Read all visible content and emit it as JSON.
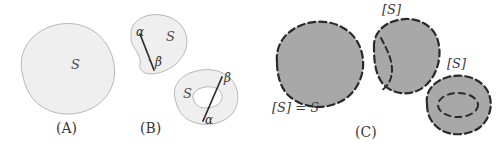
{
  "figure": {
    "background_color": "#ffffff",
    "width": 502,
    "height": 146
  },
  "panels": [
    {
      "id": "A",
      "caption": "(A)",
      "caption_x": 56,
      "caption_y": 122,
      "shapes": [
        {
          "name": "region-s-blob",
          "fill": "#efefef",
          "stroke": "#b0b0b0",
          "stroke_style": "solid",
          "stroke_width": 0.9
        }
      ],
      "labels": [
        {
          "name": "label-s",
          "text": "S",
          "x": 71,
          "y": 66,
          "kind": "italic-S"
        }
      ]
    },
    {
      "id": "B",
      "caption": "(B)",
      "caption_x": 140,
      "caption_y": 122,
      "shapes": [
        {
          "name": "region-s-slit-blob",
          "fill": "#efefef",
          "stroke": "#b0b0b0",
          "stroke_style": "solid",
          "stroke_width": 0.9
        },
        {
          "name": "slit-cut-segment",
          "fill": "none",
          "stroke": "#2d2d2d",
          "stroke_style": "solid",
          "stroke_width": 1.6
        },
        {
          "name": "region-s-hole-blob",
          "fill": "#efefef",
          "stroke": "#b0b0b0",
          "stroke_style": "solid",
          "stroke_width": 0.9
        },
        {
          "name": "inner-hole-outline",
          "fill": "#ffffff",
          "stroke": "#b0b0b0",
          "stroke_style": "solid",
          "stroke_width": 0.9
        },
        {
          "name": "hole-cut-segment",
          "fill": "none",
          "stroke": "#2d2d2d",
          "stroke_style": "solid",
          "stroke_width": 1.6
        }
      ],
      "labels": [
        {
          "name": "label-alpha-upper",
          "text": "α",
          "x": 136,
          "y": 32,
          "kind": "greek"
        },
        {
          "name": "label-beta-upper",
          "text": "β",
          "x": 155,
          "y": 63,
          "kind": "greek"
        },
        {
          "name": "label-s-upper",
          "text": "S",
          "x": 166,
          "y": 38,
          "kind": "italic-S"
        },
        {
          "name": "label-beta-lower",
          "text": "β",
          "x": 224,
          "y": 79,
          "kind": "greek"
        },
        {
          "name": "label-alpha-lower",
          "text": "α",
          "x": 209,
          "y": 118,
          "kind": "greek"
        },
        {
          "name": "label-s-lower",
          "text": "S",
          "x": 183,
          "y": 94,
          "kind": "italic-S"
        }
      ]
    },
    {
      "id": "C",
      "caption": "(C)",
      "caption_x": 355,
      "caption_y": 127,
      "shapes": [
        {
          "name": "closure-big-blob",
          "fill": "#a8a8a8",
          "stroke": "#2a2a2a",
          "stroke_style": "dashed",
          "stroke_width": 2.2
        },
        {
          "name": "closure-slit-blob",
          "fill": "#a8a8a8",
          "stroke": "#2a2a2a",
          "stroke_style": "dashed",
          "stroke_width": 2.2
        },
        {
          "name": "closure-slit-interior-arc",
          "fill": "none",
          "stroke": "#2a2a2a",
          "stroke_style": "dashed",
          "stroke_width": 2.0
        },
        {
          "name": "closure-hole-blob",
          "fill": "#a8a8a8",
          "stroke": "#2a2a2a",
          "stroke_style": "dashed",
          "stroke_width": 2.2
        },
        {
          "name": "closure-hole-interior-ellipse",
          "fill": "none",
          "stroke": "#2a2a2a",
          "stroke_style": "dashed",
          "stroke_width": 2.0
        }
      ],
      "labels": [
        {
          "name": "label-closure-equals-s",
          "text": "[S] = S",
          "x": 272,
          "y": 104,
          "kind": "equation"
        },
        {
          "name": "label-closure-middle",
          "text": "[S]",
          "x": 382,
          "y": 4,
          "kind": "bracket-S"
        },
        {
          "name": "label-closure-right",
          "text": "[S]",
          "x": 447,
          "y": 58,
          "kind": "bracket-S"
        }
      ]
    }
  ],
  "colors": {
    "light_fill": "#efefef",
    "light_stroke": "#b0b0b0",
    "dark_fill": "#a8a8a8",
    "dark_stroke": "#2a2a2a",
    "text": "#3a3a3a",
    "background": "#ffffff"
  }
}
